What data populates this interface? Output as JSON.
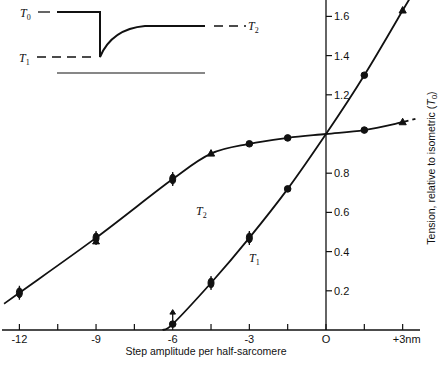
{
  "chart_data": {
    "type": "line",
    "title": "",
    "xlabel": "Step amplitude per half-sarcomere",
    "ylabel": "Tension, relative to isometric (T0)",
    "xlim": [
      -12.6,
      3.6
    ],
    "ylim": [
      0,
      1.7
    ],
    "x_ticks": [
      -12,
      -10.5,
      -9,
      -7.5,
      -6,
      -4.5,
      -3,
      -1.5,
      0,
      1.5,
      3
    ],
    "x_tick_labels": [
      {
        "value": -12,
        "label": "-12"
      },
      {
        "value": -9,
        "label": "-9"
      },
      {
        "value": -6,
        "label": "-6"
      },
      {
        "value": -3,
        "label": "-3"
      },
      {
        "value": 0,
        "label": "O"
      },
      {
        "value": 3,
        "label": "+3nm"
      }
    ],
    "y_ticks": [
      {
        "value": 0.2,
        "label": "0.2"
      },
      {
        "value": 0.4,
        "label": "0.4"
      },
      {
        "value": 0.6,
        "label": "0.6"
      },
      {
        "value": 0.8,
        "label": "0.8"
      },
      {
        "value": 1.2,
        "label": "1.2"
      },
      {
        "value": 1.4,
        "label": "1.4"
      },
      {
        "value": 1.6,
        "label": "1.6"
      }
    ],
    "grid": false,
    "legend": "none (curves labeled inline)",
    "series": [
      {
        "name": "T2",
        "label": "T2",
        "points": [
          {
            "x": -12,
            "y": 0.19,
            "marker": "diamond-errorbar"
          },
          {
            "x": -9,
            "y": 0.47,
            "marker": "triangle-errorbar"
          },
          {
            "x": -6,
            "y": 0.77,
            "marker": "diamond-errorbar"
          },
          {
            "x": -4.5,
            "y": 0.9,
            "marker": "triangle"
          },
          {
            "x": -3,
            "y": 0.95,
            "marker": "circle"
          },
          {
            "x": -1.5,
            "y": 0.98,
            "marker": "circle"
          },
          {
            "x": 0,
            "y": 1.0,
            "marker": "none"
          },
          {
            "x": 1.5,
            "y": 1.02,
            "marker": "circle"
          },
          {
            "x": 3,
            "y": 1.06,
            "marker": "triangle"
          }
        ],
        "curve_extent": {
          "x_start": -12.6,
          "x_end": 3.5,
          "dashed_after": 3.0
        }
      },
      {
        "name": "T1",
        "label": "T1",
        "points": [
          {
            "x": -6,
            "y": 0.03,
            "marker": "circle-arrow-up"
          },
          {
            "x": -4.5,
            "y": 0.24,
            "marker": "diamond-errorbar"
          },
          {
            "x": -3,
            "y": 0.47,
            "marker": "diamond-errorbar"
          },
          {
            "x": -1.5,
            "y": 0.72,
            "marker": "circle"
          },
          {
            "x": 0,
            "y": 1.0,
            "marker": "none"
          },
          {
            "x": 1.5,
            "y": 1.3,
            "marker": "circle"
          },
          {
            "x": 3,
            "y": 1.63,
            "marker": "triangle"
          }
        ],
        "curve_extent": {
          "x_start": -6.4,
          "x_end": 3.4
        }
      }
    ],
    "annotations": [
      {
        "text": "T2",
        "x": -4.9,
        "y": 0.62
      },
      {
        "text": "T1",
        "x": -2.9,
        "y": 0.36
      }
    ],
    "inset": {
      "description": "Tension transient schematic",
      "labels": {
        "t0": "T0",
        "t1": "T1",
        "t2": "T2"
      }
    }
  },
  "labels": {
    "x_axis_title": "Step amplitude per half-sarcomere",
    "y_axis_title_main": "Tension, relative to isometric (",
    "y_axis_title_sym": "T",
    "y_axis_title_sub": "0",
    "y_axis_title_end": ")",
    "curve_t2": "T",
    "curve_t2_sub": "2",
    "curve_t1": "T",
    "curve_t1_sub": "1",
    "inset_t0": "T",
    "inset_t0_sub": "0",
    "inset_t1": "T",
    "inset_t1_sub": "1",
    "inset_t2": "T",
    "inset_t2_sub": "2"
  },
  "colors": {
    "ink": "#111111",
    "background": "#ffffff"
  }
}
